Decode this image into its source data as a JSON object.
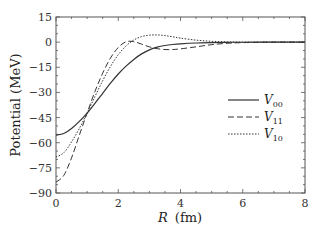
{
  "chart_data": {
    "type": "line",
    "title": "",
    "xlabel": "R (fm)",
    "xlabel_var": "R",
    "xlabel_unit": "(fm)",
    "ylabel": "Potential (MeV)",
    "xlim": [
      0,
      8
    ],
    "ylim": [
      -90,
      15
    ],
    "xticks": [
      0,
      2,
      4,
      6,
      8
    ],
    "yticks": [
      15,
      0,
      -15,
      -30,
      -45,
      -60,
      -75,
      -90
    ],
    "grid": false,
    "legend_position": "right-center",
    "series": [
      {
        "name": "V00",
        "label_main": "V",
        "label_sub": "00",
        "style": "solid",
        "x": [
          0,
          0.25,
          0.5,
          0.75,
          1.0,
          1.25,
          1.5,
          1.75,
          2.0,
          2.25,
          2.5,
          2.75,
          3.0,
          3.25,
          3.5,
          3.75,
          4.0,
          4.5,
          5.0,
          5.5,
          6.0,
          7.0,
          8.0
        ],
        "y": [
          -55.5,
          -54.5,
          -51.5,
          -47.3,
          -42.3,
          -36.5,
          -30.5,
          -24.5,
          -19.0,
          -14.3,
          -10.3,
          -7.0,
          -4.6,
          -3.0,
          -2.0,
          -1.4,
          -1.0,
          -0.5,
          -0.25,
          -0.1,
          -0.05,
          0,
          0
        ]
      },
      {
        "name": "V11",
        "label_main": "V",
        "label_sub": "11",
        "style": "dashed",
        "x": [
          0,
          0.25,
          0.5,
          0.75,
          1.0,
          1.25,
          1.5,
          1.75,
          2.0,
          2.25,
          2.5,
          2.75,
          3.0,
          3.25,
          3.5,
          3.75,
          4.0,
          4.5,
          5.0,
          5.5,
          6.0,
          7.0,
          8.0
        ],
        "y": [
          -83.5,
          -79.5,
          -69.0,
          -55.5,
          -42.3,
          -29.5,
          -18.5,
          -9.5,
          -3.2,
          0.2,
          0.3,
          -1.2,
          -2.8,
          -3.9,
          -4.4,
          -4.4,
          -4.0,
          -2.8,
          -1.5,
          -0.7,
          -0.3,
          0,
          0
        ]
      },
      {
        "name": "V10",
        "label_main": "V",
        "label_sub": "10",
        "style": "dotted",
        "x": [
          0,
          0.25,
          0.5,
          0.75,
          1.0,
          1.25,
          1.5,
          1.75,
          2.0,
          2.25,
          2.5,
          2.75,
          3.0,
          3.25,
          3.5,
          3.75,
          4.0,
          4.5,
          5.0,
          5.5,
          6.0,
          7.0,
          8.0
        ],
        "y": [
          -68.5,
          -66.0,
          -59.5,
          -51.5,
          -42.3,
          -32.5,
          -23.0,
          -14.5,
          -7.5,
          -2.3,
          1.3,
          3.3,
          4.2,
          4.3,
          3.9,
          3.2,
          2.4,
          1.2,
          0.5,
          0.2,
          0.05,
          0,
          0
        ]
      }
    ]
  },
  "legend": {
    "items": [
      {
        "main": "V",
        "sub": "00",
        "style": "solid"
      },
      {
        "main": "V",
        "sub": "11",
        "style": "dashed"
      },
      {
        "main": "V",
        "sub": "10",
        "style": "dotted"
      }
    ]
  },
  "colors": {
    "line": "#333333",
    "axis": "#555555"
  }
}
